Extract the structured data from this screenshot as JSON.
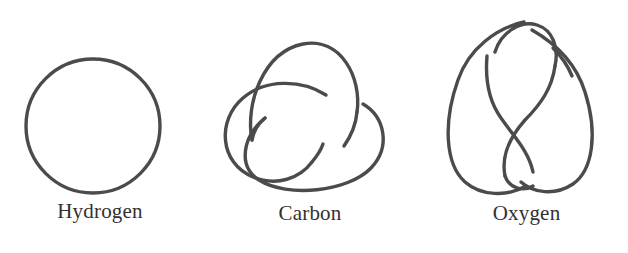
{
  "page": {
    "width": 628,
    "height": 253,
    "background_color": "#ffffff",
    "stroke_color": "#4d4a4a",
    "caption_color": "#333030",
    "stroke_width": 3.4
  },
  "figures": [
    {
      "id": "hydrogen",
      "caption": "Hydrogen",
      "knot_name": "unknot",
      "crossing_number": 0,
      "icon": "unknot-circle-icon",
      "geometry": {
        "center_x": 93,
        "center_y": 126,
        "radius": 67
      }
    },
    {
      "id": "carbon",
      "caption": "Carbon",
      "knot_name": "trefoil-knot",
      "crossing_number": 3,
      "icon": "trefoil-knot-icon",
      "geometry": {
        "center_x": 313,
        "center_y": 110,
        "lobes": 3
      }
    },
    {
      "id": "oxygen",
      "caption": "Oxygen",
      "knot_name": "figure-eight-knot",
      "crossing_number": 4,
      "icon": "figure-eight-knot-icon",
      "geometry": {
        "center_x": 528,
        "center_y": 105,
        "lobes": 2
      }
    }
  ]
}
